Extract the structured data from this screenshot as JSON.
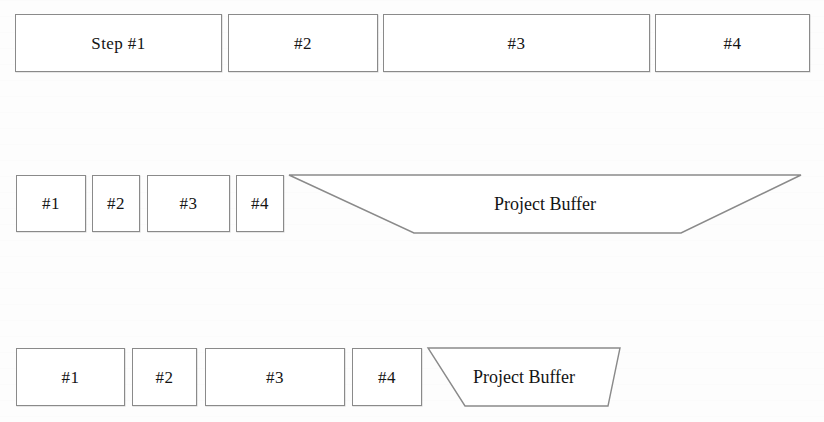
{
  "figure": {
    "background_color": "#fdfdfd",
    "stroke_color": "#8a8a8a",
    "text_color": "#141414"
  },
  "rows": [
    {
      "name": "row-original-estimates",
      "boxes": [
        {
          "label": "Step #1",
          "x": 15,
          "y": 14,
          "w": 207,
          "h": 58
        },
        {
          "label": "#2",
          "x": 228,
          "y": 14,
          "w": 150,
          "h": 58
        },
        {
          "label": "#3",
          "x": 383,
          "y": 14,
          "w": 267,
          "h": 58
        },
        {
          "label": "#4",
          "x": 655,
          "y": 14,
          "w": 155,
          "h": 58
        }
      ],
      "buffer": null
    },
    {
      "name": "row-cut-estimates-with-large-buffer",
      "boxes": [
        {
          "label": "#1",
          "x": 16,
          "y": 175,
          "w": 70,
          "h": 57
        },
        {
          "label": "#2",
          "x": 92,
          "y": 175,
          "w": 48,
          "h": 57
        },
        {
          "label": "#3",
          "x": 147,
          "y": 175,
          "w": 83,
          "h": 57
        },
        {
          "label": "#4",
          "x": 236,
          "y": 175,
          "w": 48,
          "h": 57
        }
      ],
      "buffer": {
        "label": "Project Buffer",
        "x": 289,
        "y": 175,
        "w": 512,
        "h": 58,
        "top_left_inset": 0,
        "top_right_inset": 0,
        "bottom_left_inset": 125,
        "bottom_right_inset": 120,
        "label_font_size": 18
      }
    },
    {
      "name": "row-reduced-buffer",
      "boxes": [
        {
          "label": "#1",
          "x": 16,
          "y": 348,
          "w": 109,
          "h": 58
        },
        {
          "label": "#2",
          "x": 132,
          "y": 348,
          "w": 65,
          "h": 58
        },
        {
          "label": "#3",
          "x": 205,
          "y": 348,
          "w": 140,
          "h": 58
        },
        {
          "label": "#4",
          "x": 352,
          "y": 348,
          "w": 70,
          "h": 58
        }
      ],
      "buffer": {
        "label": "Project Buffer",
        "x": 428,
        "y": 348,
        "w": 192,
        "h": 58,
        "top_left_inset": 0,
        "top_right_inset": 0,
        "bottom_left_inset": 37,
        "bottom_right_inset": 12,
        "label_font_size": 18
      }
    }
  ]
}
